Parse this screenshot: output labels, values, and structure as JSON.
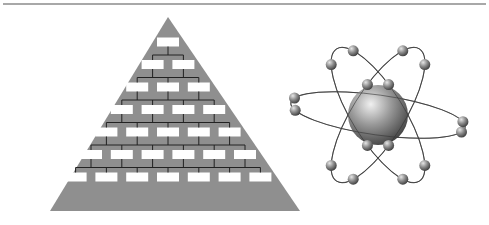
{
  "figure": {
    "title": "",
    "panels": [
      {
        "name": "hierarchy-pyramid",
        "description": "Organizational hierarchy pyramid",
        "rows": [
          1,
          2,
          3,
          4,
          5,
          6,
          7
        ],
        "colors": {
          "pyramid": "#8f8f8f",
          "box": "#ffffff",
          "connector": "#222222"
        }
      },
      {
        "name": "atom",
        "description": "Atom with nucleus and orbiting electrons",
        "orbits": 3,
        "electrons_per_orbit": [
          6,
          6,
          4
        ],
        "colors": {
          "nucleus_light": "#e8e8e8",
          "nucleus_dark": "#4a4a4a",
          "orbit": "#555555"
        }
      }
    ],
    "rule_color": "#a8a8a8"
  }
}
